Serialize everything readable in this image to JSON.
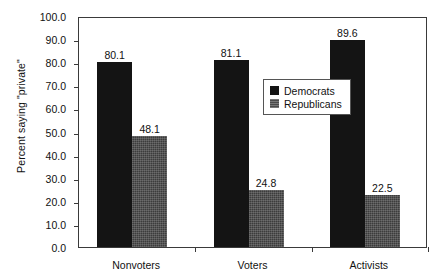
{
  "chart_data": {
    "type": "bar",
    "title": "",
    "subtitle": "",
    "xlabel": "",
    "ylabel": "Percent saying \"private\"",
    "ylim": [
      0,
      100
    ],
    "yticks": [
      "0.0",
      "10.0",
      "20.0",
      "30.0",
      "40.0",
      "50.0",
      "60.0",
      "70.0",
      "80.0",
      "90.0",
      "100.0"
    ],
    "ytick_values": [
      0,
      10,
      20,
      30,
      40,
      50,
      60,
      70,
      80,
      90,
      100
    ],
    "grid": false,
    "legend_position": "upper-center-right",
    "categories": [
      "Nonvoters",
      "Voters",
      "Activists"
    ],
    "series": [
      {
        "name": "Democrats",
        "color": "#141414",
        "values": [
          80.1,
          81.1,
          89.6
        ],
        "labels": [
          "80.1",
          "81.1",
          "89.6"
        ]
      },
      {
        "name": "Republicans",
        "color": "#3c3c3c",
        "values": [
          48.1,
          24.8,
          22.5
        ],
        "labels": [
          "48.1",
          "24.8",
          "22.5"
        ]
      }
    ]
  },
  "legend": {
    "items": [
      {
        "label": "Democrats",
        "swatch": "dem"
      },
      {
        "label": "Republicans",
        "swatch": "rep"
      }
    ]
  }
}
